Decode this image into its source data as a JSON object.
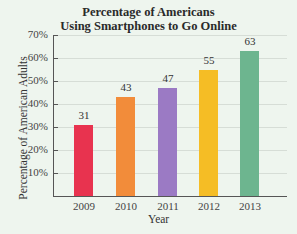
{
  "chart_data": {
    "type": "bar",
    "title_lines": [
      "Percentage of Americans",
      "Using Smartphones to Go Online"
    ],
    "xlabel": "Year",
    "ylabel": "Percentage of American Adults",
    "categories": [
      "2009",
      "2010",
      "2011",
      "2012",
      "2013"
    ],
    "values": [
      31,
      43,
      47,
      55,
      63
    ],
    "value_labels": [
      "31",
      "43",
      "47",
      "55",
      "63"
    ],
    "colors": [
      "#e8334f",
      "#f28c3a",
      "#9b7ac4",
      "#f5bd25",
      "#6db58f"
    ],
    "ylim": [
      0,
      70
    ],
    "yticks": [
      "10%",
      "20%",
      "30%",
      "40%",
      "50%",
      "60%",
      "70%"
    ],
    "grid": true,
    "legend": null
  }
}
